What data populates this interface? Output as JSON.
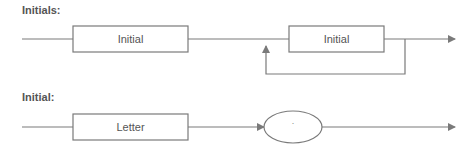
{
  "diagram": {
    "type": "railroad",
    "colors": {
      "line": "#7a7a7a",
      "text": "#555555",
      "background": "#ffffff"
    },
    "rules": [
      {
        "name": "Initials:",
        "elements": [
          {
            "kind": "nonterminal",
            "label": "Initial"
          },
          {
            "kind": "nonterminal",
            "label": "Initial",
            "repeat_loop": true
          }
        ]
      },
      {
        "name": "Initial:",
        "elements": [
          {
            "kind": "nonterminal",
            "label": "Letter"
          },
          {
            "kind": "terminal",
            "label": "."
          }
        ]
      }
    ]
  }
}
